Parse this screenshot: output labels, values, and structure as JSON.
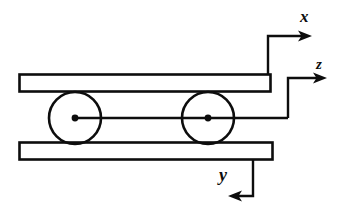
{
  "figure": {
    "background_color": "#ffffff",
    "stroke_color": "#0d0d0d",
    "canvas": {
      "width": 344,
      "height": 214
    }
  },
  "axes": {
    "x": {
      "label": "x",
      "direction": "right",
      "arrow_tip": {
        "x": 312,
        "y": 36
      },
      "corner": {
        "x": 268,
        "y": 36
      },
      "stem_end": {
        "x": 268,
        "y": 74
      }
    },
    "z": {
      "label": "z",
      "direction": "right",
      "arrow_tip": {
        "x": 327,
        "y": 78
      },
      "corner": {
        "x": 288,
        "y": 78
      },
      "stem_end": {
        "x": 288,
        "y": 118
      }
    },
    "y": {
      "label": "y",
      "direction": "left",
      "arrow_tip": {
        "x": 228,
        "y": 196
      },
      "corner": {
        "x": 253,
        "y": 196
      },
      "stem_end": {
        "x": 253,
        "y": 162
      }
    }
  },
  "plates": [
    {
      "name": "top-plate",
      "x": 19,
      "y": 74,
      "width": 251,
      "height": 17
    },
    {
      "name": "bottom-plate",
      "x": 19,
      "y": 142,
      "width": 253,
      "height": 17
    }
  ],
  "wheels": [
    {
      "name": "left-wheel",
      "cx": 75,
      "cy": 118,
      "r": 26,
      "hub_r": 3.4
    },
    {
      "name": "right-wheel",
      "cx": 208,
      "cy": 118,
      "r": 26,
      "hub_r": 3.4
    }
  ],
  "axle": {
    "name": "axle-line",
    "x1": 75,
    "y1": 118,
    "x2": 288,
    "y2": 118
  }
}
